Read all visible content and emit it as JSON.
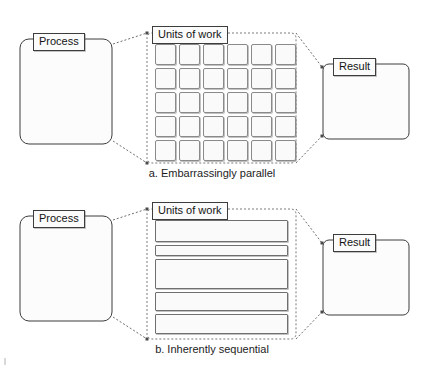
{
  "figure": {
    "background_color": "#ffffff",
    "ink_color": "#1a1a1a"
  },
  "panels": [
    {
      "id": "panel-a",
      "caption": "a. Embarrassingly parallel",
      "process": {
        "label": "Process",
        "box": {
          "x": 20,
          "y": 39,
          "w": 92,
          "h": 105,
          "radius": 9
        },
        "chip": {
          "x": 33,
          "y": 33,
          "w": 56,
          "h": 16
        }
      },
      "result": {
        "label": "Result",
        "box": {
          "x": 323,
          "y": 64,
          "w": 86,
          "h": 75,
          "radius": 6
        },
        "chip": {
          "x": 333,
          "y": 58,
          "w": 48,
          "h": 16
        }
      },
      "units": {
        "label": "Units of work",
        "chip": {
          "x": 152,
          "y": 26,
          "w": 72,
          "h": 15
        },
        "region": {
          "x": 147,
          "y": 33,
          "w": 149,
          "h": 130
        },
        "fan_left_top": {
          "x": 113,
          "y": 44
        },
        "fan_left_bottom": {
          "x": 113,
          "y": 141
        },
        "fan_right_top": {
          "x": 322,
          "y": 67
        },
        "fan_right_bottom": {
          "x": 322,
          "y": 136
        },
        "kind": "grid",
        "grid": {
          "columns": 6,
          "rows": 5,
          "cell_w": 21,
          "cell_h": 21,
          "gap_x": 3,
          "gap_y": 3,
          "origin_x": 155,
          "origin_y": 44
        }
      }
    },
    {
      "id": "panel-b",
      "caption": "b. Inherently sequential",
      "process": {
        "label": "Process",
        "box": {
          "x": 20,
          "y": 216,
          "w": 92,
          "h": 105,
          "radius": 9
        },
        "chip": {
          "x": 33,
          "y": 210,
          "w": 56,
          "h": 16
        }
      },
      "result": {
        "label": "Result",
        "box": {
          "x": 323,
          "y": 240,
          "w": 86,
          "h": 75,
          "radius": 6
        },
        "chip": {
          "x": 333,
          "y": 234,
          "w": 48,
          "h": 16
        }
      },
      "units": {
        "label": "Units of work",
        "chip": {
          "x": 152,
          "y": 202,
          "w": 72,
          "h": 15
        },
        "region": {
          "x": 147,
          "y": 209,
          "w": 149,
          "h": 130
        },
        "fan_left_top": {
          "x": 113,
          "y": 220
        },
        "fan_left_bottom": {
          "x": 113,
          "y": 317
        },
        "fan_right_top": {
          "x": 322,
          "y": 243
        },
        "fan_right_bottom": {
          "x": 322,
          "y": 312
        },
        "kind": "bars",
        "bars": [
          {
            "index": 1,
            "x": 155,
            "y": 220,
            "w": 133,
            "h": 22
          },
          {
            "index": 2,
            "x": 155,
            "y": 245,
            "w": 133,
            "h": 11
          },
          {
            "index": 3,
            "x": 155,
            "y": 259,
            "w": 133,
            "h": 30
          },
          {
            "index": 4,
            "x": 155,
            "y": 292,
            "w": 133,
            "h": 19
          },
          {
            "index": 5,
            "x": 155,
            "y": 314,
            "w": 133,
            "h": 20
          }
        ]
      }
    }
  ],
  "style": {
    "dash_pattern": "2,2",
    "dash_color": "#6e6e6e",
    "solid_color": "#3d3d3d",
    "cell_border": "#8a8a8a",
    "cell_fill": "#fafafa"
  }
}
